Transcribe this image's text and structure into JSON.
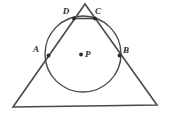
{
  "figure": {
    "kind": "geometry-diagram",
    "background_color": "#ffffff",
    "stroke_color": "#4a4a4a",
    "label_color": "#2b2b2b",
    "canvas": {
      "width": 170,
      "height": 115
    },
    "triangle": {
      "name": "outer-triangle",
      "stroke_width": 1.6,
      "vertices": [
        {
          "name": "apex",
          "x": 85,
          "y": 4
        },
        {
          "name": "bottom-right",
          "x": 157,
          "y": 105
        },
        {
          "name": "bottom-left",
          "x": 13,
          "y": 107
        }
      ]
    },
    "circle": {
      "name": "inscribed-circle",
      "cx": 83,
      "cy": 54,
      "r": 38,
      "stroke_width": 1.4
    },
    "chord": {
      "name": "chord-DC",
      "x1": 74,
      "y1": 18.5,
      "x2": 95,
      "y2": 18.5,
      "stroke_width": 1.6
    },
    "center_dot": {
      "name": "center-point-P",
      "cx": 81,
      "cy": 54.5,
      "r": 1.9
    },
    "points": [
      {
        "id": "A",
        "label": "A",
        "px": 48.5,
        "py": 55.5,
        "lx": 36,
        "ly": 52,
        "dot_r": 1.9
      },
      {
        "id": "B",
        "label": "B",
        "px": 119.5,
        "py": 55.5,
        "lx": 126,
        "ly": 53,
        "dot_r": 1.9
      },
      {
        "id": "C",
        "label": "C",
        "px": 95,
        "py": 18.5,
        "lx": 98,
        "ly": 14,
        "dot_r": 1.9
      },
      {
        "id": "D",
        "label": "D",
        "px": 74,
        "py": 18.5,
        "lx": 66,
        "ly": 14,
        "dot_r": 1.9
      },
      {
        "id": "P",
        "label": "P",
        "px": 81,
        "py": 54.5,
        "lx": 85,
        "ly": 57,
        "dot_r": 0
      }
    ]
  }
}
